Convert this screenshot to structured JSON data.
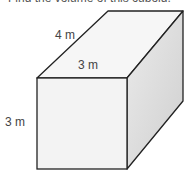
{
  "question": {
    "text": "Find the volume of this cuboid."
  },
  "figure": {
    "shape": "cuboid",
    "labels": {
      "depth": "4 m",
      "width": "3 m",
      "height": "3 m"
    },
    "colors": {
      "front_face": "#f4f4f4",
      "top_face": "#f7f7f7",
      "side_face": "#d6d6d6",
      "edge": "#222222",
      "label": "#444444"
    }
  }
}
